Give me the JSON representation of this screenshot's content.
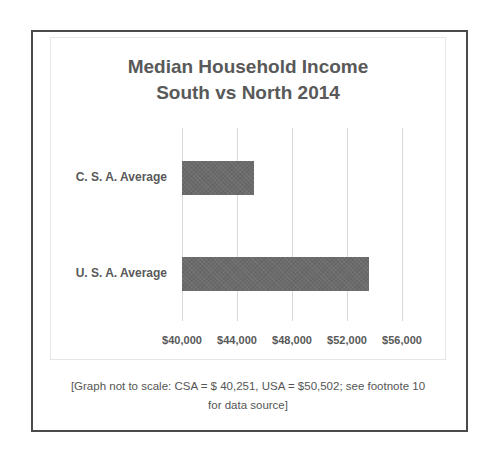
{
  "chart_data": {
    "type": "bar",
    "orientation": "horizontal",
    "title": "Median Household Income South vs North 2014",
    "title_lines": [
      "Median Household Income",
      "South vs North 2014"
    ],
    "categories": [
      "C. S. A. Average",
      "U. S. A. Average"
    ],
    "values": [
      45200,
      53600
    ],
    "xlabel": "",
    "ylabel": "",
    "xlim": [
      40000,
      58000
    ],
    "x_ticks": [
      40000,
      44000,
      48000,
      52000,
      56000
    ],
    "x_tick_labels": [
      "$40,000",
      "$44,000",
      "$48,000",
      "$52,000",
      "$56,000"
    ],
    "grid": "vertical",
    "legend": "none",
    "bar_color": "#6b6b6b",
    "annotation": "[Graph not to scale: CSA = $ 40,251, USA = $50,502; see footnote 10 for data source]",
    "stated_values": {
      "CSA": 40251,
      "USA": 50502
    }
  },
  "footnote": {
    "line1": "[Graph not to scale: CSA = $ 40,251, USA = $50,502; see footnote 10",
    "line2": "for data source]"
  },
  "colors": {
    "bar": "#6b6b6b",
    "text": "#595959",
    "grid": "#d9d9d9",
    "frame": "#4a4a4a"
  }
}
